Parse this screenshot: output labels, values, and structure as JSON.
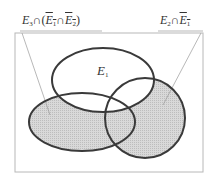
{
  "diagram": {
    "type": "venn",
    "universe": {
      "x": 15,
      "y": 33,
      "width": 188,
      "height": 139,
      "stroke": "#b8b8b8"
    },
    "sets": [
      {
        "id": "E1",
        "label": "E",
        "sub": "1",
        "cx": 103,
        "cy": 80,
        "rx": 51,
        "ry": 32,
        "shaded": false
      },
      {
        "id": "E2",
        "cx": 145,
        "cy": 118,
        "rx": 40,
        "ry": 40,
        "shaded": true
      },
      {
        "id": "E3",
        "cx": 82,
        "cy": 122,
        "rx": 53,
        "ry": 29,
        "shaded": true
      }
    ],
    "shade_color": "#d4d4d4",
    "outline_color": "#3a3a3a",
    "callouts": [
      {
        "id": "left",
        "text": "E3 ∩ (Ē1 ∩ Ē2)",
        "parts": {
          "a": "E",
          "a_sub": "3",
          "op1": "∩(",
          "b": "E",
          "b_sub": "1",
          "op2": "∩",
          "c": "E",
          "c_sub": "2",
          "close": ")"
        },
        "line_from": [
          22,
          33
        ],
        "line_to": [
          50,
          115
        ]
      },
      {
        "id": "right",
        "text": "E2 ∩ Ē1",
        "parts": {
          "a": "E",
          "a_sub": "2",
          "op1": "∩",
          "b": "E",
          "b_sub": "1"
        },
        "line_from": [
          201,
          33
        ],
        "line_to": [
          163,
          105
        ]
      }
    ]
  }
}
